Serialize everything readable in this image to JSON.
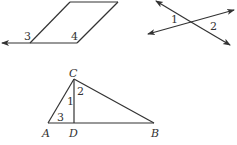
{
  "figures": {
    "parallelogram": {
      "angle_labels": [
        "3",
        "4"
      ]
    },
    "intersecting_lines": {
      "angle_labels": [
        "1",
        "2"
      ]
    },
    "triangle": {
      "vertices": [
        "A",
        "B",
        "C",
        "D"
      ],
      "angle_labels": [
        "1",
        "2",
        "3"
      ]
    }
  },
  "colors": {
    "stroke": "#333333",
    "background": "#ffffff"
  }
}
